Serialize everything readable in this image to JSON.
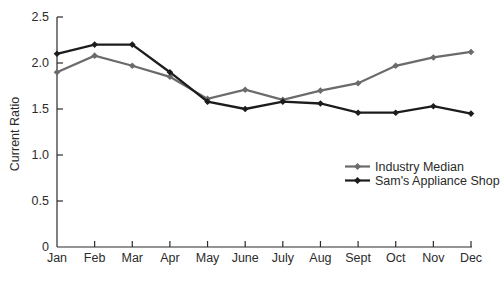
{
  "chart_data": {
    "type": "line",
    "title": "",
    "ylabel": "Current Ratio",
    "xlabel": "",
    "ylim": [
      0,
      2.5
    ],
    "ytick_labels": [
      "0",
      "0.5",
      "1.0",
      "1.5",
      "2.0",
      "2.5"
    ],
    "grid": false,
    "legend_position": "center-right",
    "categories": [
      "Jan",
      "Feb",
      "Mar",
      "Apr",
      "May",
      "June",
      "July",
      "Aug",
      "Sept",
      "Oct",
      "Nov",
      "Dec"
    ],
    "series": [
      {
        "name": "Industry Median",
        "color": "#6b6b6b",
        "marker": "diamond",
        "values": [
          1.9,
          2.08,
          1.97,
          1.85,
          1.61,
          1.71,
          1.6,
          1.7,
          1.78,
          1.97,
          2.06,
          2.12
        ]
      },
      {
        "name": "Sam's Appliance Shop",
        "color": "#1c1c1c",
        "marker": "diamond",
        "values": [
          2.1,
          2.2,
          2.2,
          1.9,
          1.58,
          1.5,
          1.58,
          1.56,
          1.46,
          1.46,
          1.53,
          1.45
        ]
      }
    ],
    "axis_color": "#2b2b2b"
  }
}
